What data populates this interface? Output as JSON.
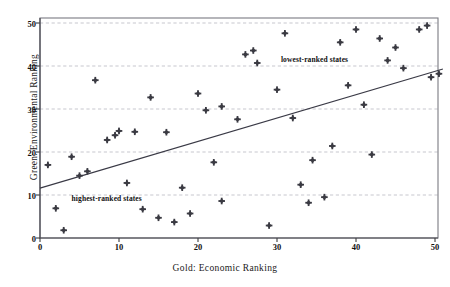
{
  "chart_data": {
    "type": "scatter",
    "title": "",
    "xlabel": "Gold: Economic Ranking",
    "ylabel": "Green: Environmental Ranking",
    "xlim": [
      0,
      51
    ],
    "ylim": [
      0,
      52
    ],
    "xticks": [
      0,
      10,
      20,
      30,
      40,
      50
    ],
    "yticks": [
      0,
      10,
      20,
      30,
      40,
      50
    ],
    "grid": "horizontal-dashed",
    "legend": "none",
    "marker": "diamond",
    "marker_color": "#3a3a42",
    "trendline": {
      "label": "",
      "color": "#3a3a46",
      "x": [
        0,
        51
      ],
      "y": [
        11.6,
        39.3
      ]
    },
    "annotations": [
      {
        "text": "highest-ranked states",
        "x": 4.0,
        "y": 9.2
      },
      {
        "text": "lowest-ranked states",
        "x": 30.5,
        "y": 41.7
      }
    ],
    "points": [
      {
        "x": 1,
        "y": 17.0
      },
      {
        "x": 2,
        "y": 6.9
      },
      {
        "x": 3,
        "y": 1.8
      },
      {
        "x": 4,
        "y": 18.9
      },
      {
        "x": 5,
        "y": 14.5
      },
      {
        "x": 6,
        "y": 15.5
      },
      {
        "x": 7,
        "y": 36.7
      },
      {
        "x": 8.5,
        "y": 22.8
      },
      {
        "x": 9.5,
        "y": 23.9
      },
      {
        "x": 10,
        "y": 24.9
      },
      {
        "x": 11,
        "y": 12.8
      },
      {
        "x": 12,
        "y": 24.7
      },
      {
        "x": 13,
        "y": 6.7
      },
      {
        "x": 14,
        "y": 32.7
      },
      {
        "x": 15,
        "y": 4.7
      },
      {
        "x": 16,
        "y": 24.6
      },
      {
        "x": 17,
        "y": 3.7
      },
      {
        "x": 18,
        "y": 11.7
      },
      {
        "x": 19,
        "y": 5.7
      },
      {
        "x": 20,
        "y": 33.6
      },
      {
        "x": 21,
        "y": 29.7
      },
      {
        "x": 22,
        "y": 17.6
      },
      {
        "x": 23,
        "y": 30.6
      },
      {
        "x": 23,
        "y": 8.6
      },
      {
        "x": 25,
        "y": 27.6
      },
      {
        "x": 26,
        "y": 42.7
      },
      {
        "x": 27,
        "y": 43.6
      },
      {
        "x": 27.5,
        "y": 40.7
      },
      {
        "x": 29,
        "y": 2.9
      },
      {
        "x": 30,
        "y": 34.5
      },
      {
        "x": 31,
        "y": 47.6
      },
      {
        "x": 32,
        "y": 27.9
      },
      {
        "x": 33,
        "y": 12.4
      },
      {
        "x": 34,
        "y": 8.2
      },
      {
        "x": 34.5,
        "y": 18.1
      },
      {
        "x": 36,
        "y": 9.5
      },
      {
        "x": 37,
        "y": 21.4
      },
      {
        "x": 38,
        "y": 45.5
      },
      {
        "x": 39,
        "y": 35.5
      },
      {
        "x": 40,
        "y": 48.5
      },
      {
        "x": 41,
        "y": 31.0
      },
      {
        "x": 42,
        "y": 19.4
      },
      {
        "x": 43,
        "y": 46.4
      },
      {
        "x": 44,
        "y": 41.3
      },
      {
        "x": 45,
        "y": 44.3
      },
      {
        "x": 46,
        "y": 39.5
      },
      {
        "x": 48,
        "y": 48.5
      },
      {
        "x": 49,
        "y": 49.4
      },
      {
        "x": 49.5,
        "y": 37.4
      },
      {
        "x": 50.5,
        "y": 38.2
      }
    ]
  },
  "axes": {
    "y_tick_labels": [
      "0",
      "10",
      "20",
      "30",
      "40",
      "50"
    ],
    "x_tick_labels": [
      "0",
      "10",
      "20",
      "30",
      "40",
      "50"
    ],
    "x_title": "Gold: Economic Ranking",
    "y_title": "Green: Environmental Ranking"
  },
  "annotations": {
    "highest": "highest-ranked states",
    "lowest": "lowest-ranked states"
  },
  "colors": {
    "marker": "#3a3a42",
    "trendline": "#3a3a46",
    "grid": "#b9b9c2",
    "frame": "#7a7a82",
    "background": "#ffffff"
  }
}
